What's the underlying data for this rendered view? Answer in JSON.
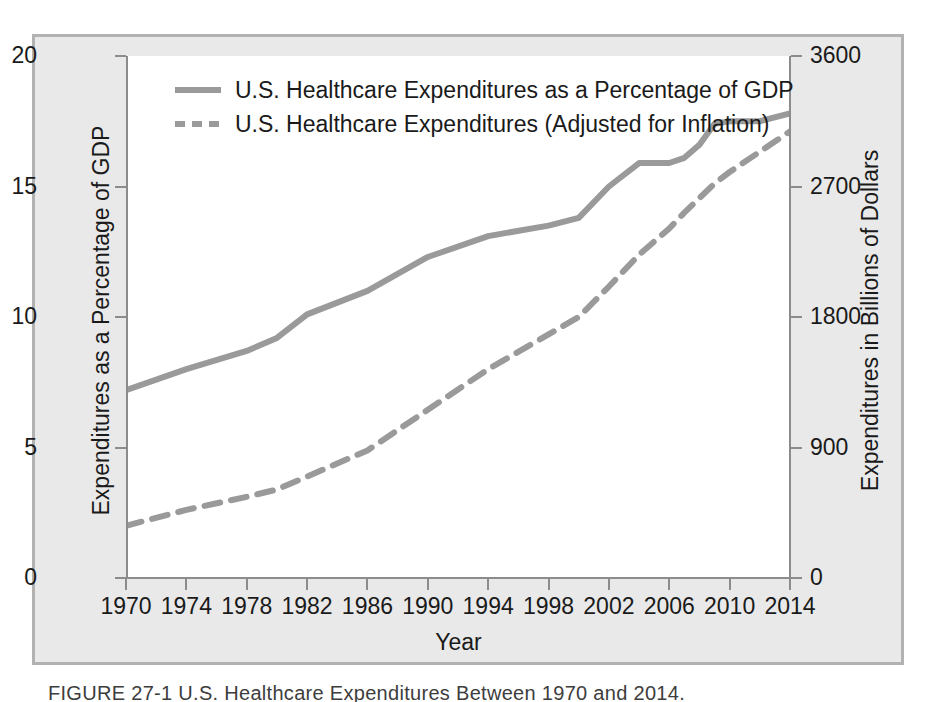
{
  "figure": {
    "caption": "FIGURE 27-1 U.S. Healthcare Expenditures Between 1970 and 2014.",
    "frame_color": "#b2b2b2",
    "panel_color": "#e9e9e9",
    "plot_background": "#ffffff"
  },
  "legend": {
    "position": "top-left-inside",
    "items": [
      {
        "label": "U.S. Healthcare Expenditures as a Percentage of GDP",
        "style": "solid",
        "color": "#9a9a9a"
      },
      {
        "label": "U.S. Healthcare Expenditures (Adjusted for Inflation)",
        "style": "dashed",
        "color": "#9a9a9a"
      }
    ]
  },
  "chart_data": {
    "type": "line",
    "title": "",
    "subtitle": "",
    "xlabel": "Year",
    "ylabel": "Expenditures as a Percentage of GDP",
    "y2label": "Expenditures in Billions of Dollars",
    "xlim": [
      1970,
      2014
    ],
    "ylim": [
      0,
      20
    ],
    "y2lim": [
      0,
      3600
    ],
    "grid": false,
    "xticks": [
      1970,
      1974,
      1978,
      1982,
      1986,
      1990,
      1994,
      1998,
      2002,
      2006,
      2010,
      2014
    ],
    "xtick_labels": [
      "1970",
      "1974",
      "1978",
      "1982",
      "1986",
      "1990",
      "1994",
      "1998",
      "2002",
      "2006",
      "2010",
      "2014"
    ],
    "yticks": [
      0,
      5,
      10,
      15,
      20
    ],
    "ytick_labels": [
      "0",
      "5",
      "10",
      "15",
      "20"
    ],
    "y2ticks": [
      0,
      900,
      1800,
      2700,
      3600
    ],
    "y2tick_labels": [
      "0",
      "900",
      "1800",
      "2700",
      "3600"
    ],
    "x": [
      1970,
      1974,
      1978,
      1980,
      1982,
      1986,
      1990,
      1994,
      1998,
      2000,
      2002,
      2004,
      2006,
      2007,
      2008,
      2009,
      2010,
      2012,
      2014
    ],
    "series": [
      {
        "name": "U.S. Healthcare Expenditures as a Percentage of GDP",
        "axis": "left",
        "units": "percent of GDP",
        "style": "solid",
        "color": "#9a9a9a",
        "values": [
          7.2,
          8.0,
          8.7,
          9.2,
          10.1,
          11.0,
          12.3,
          13.1,
          13.5,
          13.8,
          15.0,
          15.9,
          15.9,
          16.1,
          16.6,
          17.4,
          17.5,
          17.5,
          17.8
        ]
      },
      {
        "name": "U.S. Healthcare Expenditures (Adjusted for Inflation)",
        "axis": "right",
        "units": "billions of dollars",
        "style": "dashed",
        "color": "#9a9a9a",
        "values": [
          360,
          470,
          560,
          610,
          700,
          880,
          1160,
          1440,
          1680,
          1800,
          2010,
          2230,
          2410,
          2520,
          2620,
          2720,
          2800,
          2940,
          3080
        ]
      }
    ]
  }
}
